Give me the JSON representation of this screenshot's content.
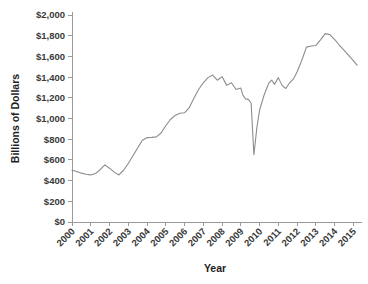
{
  "chart_data": {
    "type": "line",
    "title": "",
    "xlabel": "Year",
    "ylabel": "Billions of Dollars",
    "xlim": [
      2000,
      2015.25
    ],
    "ylim": [
      0,
      2000
    ],
    "grid": false,
    "legend": null,
    "line_color": "#8c8c8c",
    "axis_color": "#9a9a9a",
    "text_color": "#3a3a3a",
    "x_tick_labels": [
      "2000",
      "2001",
      "2002",
      "2003",
      "2004",
      "2005",
      "2006",
      "2007",
      "2008",
      "2009",
      "2010",
      "2011",
      "2012",
      "2013",
      "2014",
      "2015"
    ],
    "x_tick_values": [
      2000,
      2001,
      2002,
      2003,
      2004,
      2005,
      2006,
      2007,
      2008,
      2009,
      2010,
      2011,
      2012,
      2013,
      2014,
      2015
    ],
    "y_tick_labels": [
      "$0",
      "$200",
      "$400",
      "$600",
      "$800",
      "$1,000",
      "$1,200",
      "$1,400",
      "$1,600",
      "$1,800",
      "$2,000"
    ],
    "y_tick_values": [
      0,
      200,
      400,
      600,
      800,
      1000,
      1200,
      1400,
      1600,
      1800,
      2000
    ],
    "series": [
      {
        "name": "Value",
        "points": [
          [
            2000.0,
            500
          ],
          [
            2000.25,
            488
          ],
          [
            2000.5,
            472
          ],
          [
            2000.75,
            462
          ],
          [
            2001.0,
            455
          ],
          [
            2001.25,
            468
          ],
          [
            2001.5,
            505
          ],
          [
            2001.75,
            552
          ],
          [
            2002.0,
            520
          ],
          [
            2002.25,
            482
          ],
          [
            2002.5,
            455
          ],
          [
            2002.75,
            500
          ],
          [
            2003.0,
            565
          ],
          [
            2003.25,
            640
          ],
          [
            2003.5,
            715
          ],
          [
            2003.75,
            790
          ],
          [
            2004.0,
            815
          ],
          [
            2004.25,
            818
          ],
          [
            2004.5,
            822
          ],
          [
            2004.75,
            860
          ],
          [
            2005.0,
            930
          ],
          [
            2005.25,
            990
          ],
          [
            2005.5,
            1030
          ],
          [
            2005.75,
            1050
          ],
          [
            2006.0,
            1055
          ],
          [
            2006.25,
            1105
          ],
          [
            2006.5,
            1195
          ],
          [
            2006.75,
            1280
          ],
          [
            2007.0,
            1345
          ],
          [
            2007.25,
            1395
          ],
          [
            2007.5,
            1420
          ],
          [
            2007.75,
            1370
          ],
          [
            2008.0,
            1405
          ],
          [
            2008.25,
            1320
          ],
          [
            2008.5,
            1345
          ],
          [
            2008.75,
            1280
          ],
          [
            2009.0,
            1295
          ],
          [
            2009.1,
            1230
          ],
          [
            2009.25,
            1190
          ],
          [
            2009.4,
            1185
          ],
          [
            2009.55,
            1150
          ],
          [
            2009.7,
            650
          ],
          [
            2009.85,
            900
          ],
          [
            2010.0,
            1080
          ],
          [
            2010.25,
            1230
          ],
          [
            2010.5,
            1345
          ],
          [
            2010.65,
            1370
          ],
          [
            2010.8,
            1330
          ],
          [
            2011.0,
            1395
          ],
          [
            2011.2,
            1320
          ],
          [
            2011.4,
            1290
          ],
          [
            2011.6,
            1345
          ],
          [
            2011.8,
            1380
          ],
          [
            2012.0,
            1450
          ],
          [
            2012.25,
            1560
          ],
          [
            2012.5,
            1690
          ],
          [
            2012.75,
            1700
          ],
          [
            2013.0,
            1705
          ],
          [
            2013.25,
            1760
          ],
          [
            2013.5,
            1820
          ],
          [
            2013.75,
            1810
          ],
          [
            2014.0,
            1765
          ],
          [
            2014.25,
            1710
          ],
          [
            2014.5,
            1660
          ],
          [
            2014.75,
            1610
          ],
          [
            2015.0,
            1560
          ],
          [
            2015.2,
            1515
          ]
        ]
      }
    ]
  }
}
